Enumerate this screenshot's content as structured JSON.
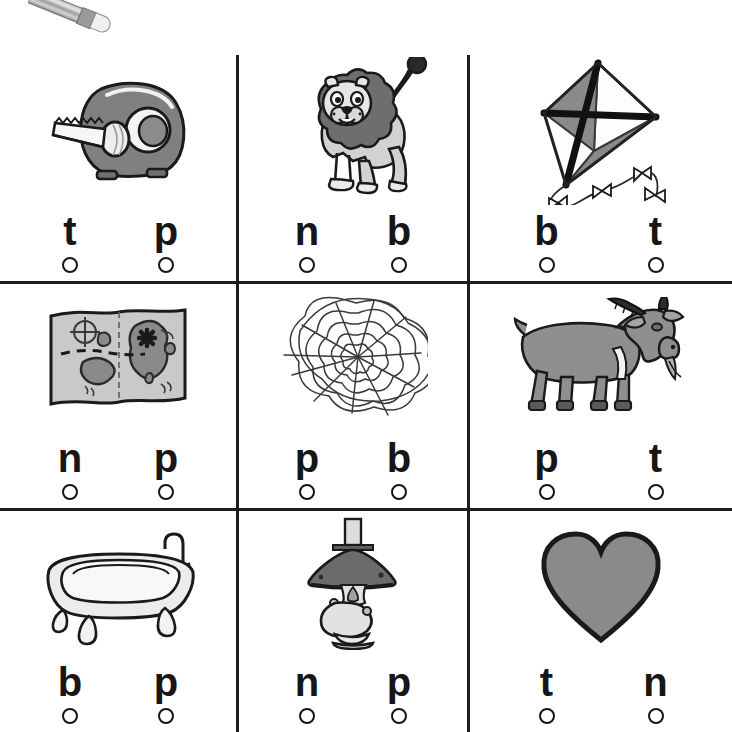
{
  "worksheet": {
    "title": "Beginning Sounds Worksheet",
    "decoration": {
      "pencil_icon": "pencil-icon"
    },
    "grid": {
      "rows": 3,
      "columns": 3,
      "line_color": "#1c1c1c"
    },
    "cells": [
      {
        "id": "cell-1",
        "picture": "tape-dispenser",
        "picture_label": "tape",
        "choices": [
          {
            "letter": "t",
            "bubble": "empty"
          },
          {
            "letter": "p",
            "bubble": "empty"
          }
        ]
      },
      {
        "id": "cell-2",
        "picture": "lion",
        "picture_label": "lion",
        "choices": [
          {
            "letter": "n",
            "bubble": "empty"
          },
          {
            "letter": "b",
            "bubble": "empty"
          }
        ]
      },
      {
        "id": "cell-3",
        "picture": "kite",
        "picture_label": "kite",
        "choices": [
          {
            "letter": "b",
            "bubble": "empty"
          },
          {
            "letter": "t",
            "bubble": "empty"
          }
        ]
      },
      {
        "id": "cell-4",
        "picture": "map",
        "picture_label": "map",
        "choices": [
          {
            "letter": "n",
            "bubble": "empty"
          },
          {
            "letter": "p",
            "bubble": "empty"
          }
        ]
      },
      {
        "id": "cell-5",
        "picture": "spider-web",
        "picture_label": "web",
        "choices": [
          {
            "letter": "p",
            "bubble": "empty"
          },
          {
            "letter": "b",
            "bubble": "empty"
          }
        ]
      },
      {
        "id": "cell-6",
        "picture": "goat",
        "picture_label": "goat",
        "choices": [
          {
            "letter": "p",
            "bubble": "empty"
          },
          {
            "letter": "t",
            "bubble": "empty"
          }
        ]
      },
      {
        "id": "cell-7",
        "picture": "bathtub",
        "picture_label": "tub",
        "choices": [
          {
            "letter": "b",
            "bubble": "empty"
          },
          {
            "letter": "p",
            "bubble": "empty"
          }
        ]
      },
      {
        "id": "cell-8",
        "picture": "oil-lamp",
        "picture_label": "lamp",
        "choices": [
          {
            "letter": "n",
            "bubble": "empty"
          },
          {
            "letter": "p",
            "bubble": "empty"
          }
        ]
      },
      {
        "id": "cell-9",
        "picture": "heart",
        "picture_label": "heart",
        "choices": [
          {
            "letter": "t",
            "bubble": "empty"
          },
          {
            "letter": "n",
            "bubble": "empty"
          }
        ]
      }
    ]
  },
  "colors": {
    "ink": "#161616",
    "rule": "#1c1c1c",
    "paper": "#ffffff",
    "mid_gray": "#808080",
    "light_gray": "#c9c9c9",
    "dark_gray": "#555555",
    "pale_gray": "#e4e4e4"
  }
}
